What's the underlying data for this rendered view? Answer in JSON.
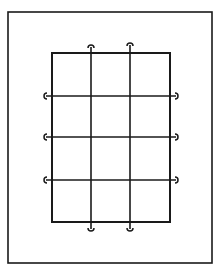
{
  "diagram": {
    "colors": {
      "stroke": "#1a1a1a",
      "background": "#ffffff"
    },
    "outer_frame": {
      "x": 8,
      "y": 12,
      "w": 204,
      "h": 251
    },
    "inner_rect": {
      "x": 52,
      "y": 53,
      "w": 118,
      "h": 169
    },
    "vertical_lines": [
      {
        "x": 91,
        "y1": 47,
        "y2": 229,
        "top_hook": "open-bottom",
        "bottom_hook": "open-top"
      },
      {
        "x": 130,
        "y1": 45,
        "y2": 229,
        "top_hook": "open-bottom",
        "bottom_hook": "open-top"
      }
    ],
    "horizontal_lines": [
      {
        "y": 96,
        "x1": 46,
        "x2": 176,
        "left_hook": "open-right",
        "right_hook": "open-left"
      },
      {
        "y": 137,
        "x1": 46,
        "x2": 176,
        "left_hook": "open-right",
        "right_hook": "open-left"
      },
      {
        "y": 180,
        "x1": 46,
        "x2": 176,
        "left_hook": "open-right",
        "right_hook": "open-left"
      }
    ]
  }
}
